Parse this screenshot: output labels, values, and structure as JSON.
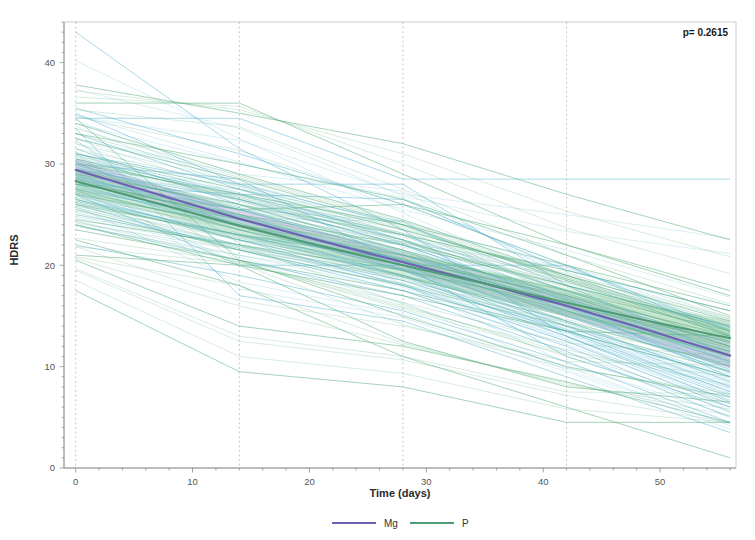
{
  "chart_data": {
    "type": "line",
    "title": "",
    "subtitle": "",
    "xlabel": "Time (days)",
    "ylabel": "HDRS",
    "xlim": [
      -1,
      56.5
    ],
    "ylim": [
      0,
      44
    ],
    "xticks": [
      0,
      10,
      20,
      30,
      40,
      50
    ],
    "xtick_labels": [
      "0",
      "10",
      "20",
      "30",
      "40",
      "50"
    ],
    "yticks": [
      0,
      10,
      20,
      30,
      40
    ],
    "ytick_labels": [
      "0",
      "10",
      "20",
      "30",
      "40"
    ],
    "grid": "vertical dashed gridlines at visit days",
    "gridlines_x": [
      0,
      14,
      28,
      42
    ],
    "legend_position": "bottom-center",
    "annotations": [
      {
        "name": "p-value",
        "text": "p=  0.2615",
        "x_frac": 0.93,
        "y_frac": 0.055
      }
    ],
    "colors": {
      "mg_line": "#6f5fb5",
      "mg_band": "#b9b2dd",
      "p_line": "#4e9b76",
      "p_band": "#a9d8b8",
      "spaghetti_mg": "#63b9d6",
      "spaghetti_p": "#58b07e",
      "axis": "#8a8a8a",
      "text": "#333333",
      "grid": "#9a9a9a"
    },
    "x": [
      0,
      7,
      14,
      21,
      28,
      35,
      42,
      49,
      56
    ],
    "series": [
      {
        "name": "Mg",
        "color": "#6f5fb5",
        "values": [
          29.4,
          27.0,
          24.6,
          22.4,
          20.3,
          18.2,
          16.0,
          13.6,
          11.1
        ],
        "band_lower": [
          28.3,
          26.1,
          23.8,
          21.6,
          19.4,
          17.2,
          14.9,
          12.4,
          9.8
        ],
        "band_upper": [
          30.5,
          27.9,
          25.5,
          23.3,
          21.2,
          19.2,
          17.1,
          14.8,
          12.5
        ]
      },
      {
        "name": "P",
        "color": "#4e9b76",
        "values": [
          28.3,
          26.1,
          23.9,
          21.9,
          20.0,
          18.2,
          16.3,
          14.5,
          12.8
        ],
        "band_lower": [
          27.0,
          25.0,
          22.8,
          20.8,
          18.8,
          16.9,
          14.9,
          12.9,
          10.9
        ],
        "band_upper": [
          29.6,
          27.2,
          25.0,
          23.0,
          21.2,
          19.5,
          17.7,
          16.0,
          14.6
        ]
      }
    ],
    "legend": [
      {
        "label": "Mg",
        "color": "#6f5fb5"
      },
      {
        "label": "P",
        "color": "#4e9b76"
      }
    ],
    "individual_trajectories": {
      "description": "Faint per-subject HDRS trajectories, measured at days 0, 14, 28, 42, 56",
      "mg_subjects": [
        [
          43.0,
          31.5,
          23.5,
          13.0,
          6.5
        ],
        [
          34.5,
          34.5,
          28.5,
          28.5,
          28.5
        ],
        [
          35.0,
          28.0,
          24.0,
          18.0,
          11.0
        ],
        [
          33.0,
          27.5,
          22.5,
          16.0,
          9.0
        ],
        [
          31.5,
          26.0,
          21.5,
          15.5,
          10.0
        ],
        [
          30.5,
          27.0,
          23.0,
          17.5,
          12.0
        ],
        [
          30.0,
          25.0,
          20.0,
          14.5,
          8.5
        ],
        [
          29.5,
          26.5,
          22.0,
          16.5,
          11.5
        ],
        [
          29.0,
          24.0,
          19.5,
          13.5,
          7.5
        ],
        [
          28.5,
          25.5,
          21.0,
          16.0,
          10.5
        ],
        [
          28.0,
          23.5,
          19.0,
          13.0,
          7.0
        ],
        [
          27.5,
          24.5,
          20.5,
          15.0,
          9.5
        ],
        [
          27.0,
          22.5,
          18.0,
          12.5,
          6.0
        ],
        [
          26.5,
          23.0,
          19.5,
          14.0,
          8.0
        ],
        [
          26.0,
          21.5,
          17.5,
          12.0,
          5.5
        ],
        [
          25.0,
          22.0,
          18.5,
          13.5,
          9.0
        ],
        [
          24.0,
          20.5,
          17.0,
          11.5,
          5.0
        ],
        [
          31.0,
          28.0,
          28.0,
          18.0,
          14.0
        ],
        [
          35.5,
          31.0,
          26.0,
          20.0,
          13.5
        ],
        [
          22.0,
          19.0,
          15.5,
          10.5,
          4.5
        ],
        [
          33.5,
          17.0,
          14.5,
          9.0,
          3.5
        ],
        [
          30.0,
          28.5,
          20.0,
          11.0,
          6.0
        ],
        [
          28.0,
          27.0,
          26.5,
          19.5,
          15.5
        ],
        [
          27.0,
          20.0,
          20.0,
          20.0,
          13.0
        ]
      ],
      "p_subjects": [
        [
          37.8,
          35.0,
          32.0,
          27.0,
          22.5
        ],
        [
          36.0,
          36.0,
          29.0,
          22.0,
          17.5
        ],
        [
          34.0,
          29.0,
          24.5,
          19.0,
          13.5
        ],
        [
          32.5,
          28.5,
          24.0,
          18.5,
          13.0
        ],
        [
          31.0,
          27.5,
          23.5,
          19.0,
          14.5
        ],
        [
          30.5,
          26.5,
          22.5,
          17.5,
          12.5
        ],
        [
          30.0,
          27.0,
          24.0,
          20.0,
          16.0
        ],
        [
          29.5,
          25.5,
          21.5,
          17.0,
          12.0
        ],
        [
          29.0,
          26.0,
          23.0,
          19.5,
          15.5
        ],
        [
          28.5,
          24.5,
          20.5,
          16.0,
          11.5
        ],
        [
          28.0,
          25.0,
          22.0,
          18.0,
          14.0
        ],
        [
          27.5,
          23.5,
          20.0,
          15.5,
          11.0
        ],
        [
          27.0,
          24.0,
          21.0,
          17.5,
          13.5
        ],
        [
          26.5,
          22.5,
          19.0,
          14.5,
          10.0
        ],
        [
          26.0,
          23.0,
          20.5,
          17.0,
          13.0
        ],
        [
          25.5,
          21.5,
          18.0,
          14.0,
          9.5
        ],
        [
          24.5,
          22.0,
          19.5,
          16.0,
          12.5
        ],
        [
          23.5,
          20.5,
          17.5,
          13.5,
          9.0
        ],
        [
          21.0,
          20.0,
          12.5,
          8.0,
          6.5
        ],
        [
          20.5,
          14.0,
          12.0,
          8.5,
          4.5
        ],
        [
          17.5,
          9.5,
          8.0,
          4.5,
          4.5
        ],
        [
          24.0,
          20.0,
          17.0,
          13.5,
          13.0
        ],
        [
          34.5,
          20.5,
          15.0,
          10.0,
          7.0
        ],
        [
          28.0,
          25.5,
          26.0,
          22.0,
          17.0
        ],
        [
          22.5,
          18.0,
          11.0,
          6.0,
          1.0
        ],
        [
          33.0,
          30.0,
          26.5,
          21.0,
          15.0
        ]
      ]
    }
  }
}
